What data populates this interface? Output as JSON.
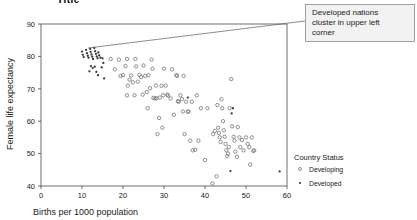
{
  "title_clipped": "Title",
  "callout": {
    "text_line1": "Developed nations",
    "text_line2": "cluster in upper left",
    "text_line3": "corner"
  },
  "legend": {
    "title": "Country Status",
    "items": [
      {
        "label": "Developing",
        "marker": "open-circle"
      },
      {
        "label": "Developed",
        "marker": "filled-dot"
      }
    ]
  },
  "chart_data": {
    "type": "scatter",
    "title": "",
    "xlabel": "Births per 1000 population",
    "ylabel": "Female life expectancy",
    "xlim": [
      0,
      60
    ],
    "ylim": [
      40,
      90
    ],
    "xticks": [
      0,
      10,
      20,
      30,
      40,
      50,
      60
    ],
    "yticks": [
      40,
      50,
      60,
      70,
      80,
      90
    ],
    "grid": false,
    "legend_position": "right",
    "annotation": "Developed nations cluster in upper left corner",
    "series": [
      {
        "name": "Developed",
        "marker": "filled-dot",
        "points": [
          [
            10.0,
            81.5
          ],
          [
            10.2,
            80.5
          ],
          [
            10.4,
            79.8
          ],
          [
            11.0,
            82.0
          ],
          [
            11.2,
            81.0
          ],
          [
            11.4,
            80.2
          ],
          [
            11.6,
            79.6
          ],
          [
            12.0,
            82.3
          ],
          [
            12.1,
            81.4
          ],
          [
            12.3,
            80.6
          ],
          [
            12.5,
            79.9
          ],
          [
            12.7,
            79.2
          ],
          [
            13.0,
            82.6
          ],
          [
            13.2,
            81.6
          ],
          [
            13.4,
            80.8
          ],
          [
            13.6,
            80.0
          ],
          [
            13.8,
            79.4
          ],
          [
            14.0,
            81.2
          ],
          [
            14.2,
            80.3
          ],
          [
            12.2,
            77.0
          ],
          [
            12.6,
            76.4
          ],
          [
            13.1,
            76.8
          ],
          [
            13.5,
            75.2
          ],
          [
            11.8,
            75.4
          ],
          [
            14.5,
            79.6
          ],
          [
            15.0,
            79.4
          ],
          [
            15.2,
            78.0
          ],
          [
            14.8,
            76.6
          ],
          [
            13.9,
            74.2
          ],
          [
            15.4,
            73.2
          ],
          [
            35.8,
            67.3
          ],
          [
            46.5,
            62.4
          ],
          [
            46.8,
            64.0
          ],
          [
            46.2,
            44.6
          ],
          [
            58.2,
            44.5
          ]
        ]
      },
      {
        "name": "Developing",
        "marker": "open-circle",
        "points": [
          [
            17.0,
            79.2
          ],
          [
            18.0,
            76.0
          ],
          [
            19.0,
            79.0
          ],
          [
            19.4,
            74.0
          ],
          [
            20.0,
            74.2
          ],
          [
            20.6,
            77.0
          ],
          [
            21.0,
            79.2
          ],
          [
            21.2,
            71.0
          ],
          [
            21.0,
            68.0
          ],
          [
            21.6,
            72.8
          ],
          [
            22.0,
            74.1
          ],
          [
            22.4,
            72.0
          ],
          [
            23.0,
            79.2
          ],
          [
            23.2,
            76.9
          ],
          [
            23.6,
            72.2
          ],
          [
            24.0,
            74.3
          ],
          [
            24.4,
            73.6
          ],
          [
            25.0,
            77.2
          ],
          [
            25.4,
            74.0
          ],
          [
            25.8,
            69.0
          ],
          [
            26.0,
            64.0
          ],
          [
            26.6,
            70.2
          ],
          [
            27.0,
            79.0
          ],
          [
            27.2,
            76.2
          ],
          [
            27.4,
            67.2
          ],
          [
            27.8,
            67.0
          ],
          [
            28.0,
            71.0
          ],
          [
            28.2,
            67.1
          ],
          [
            28.4,
            56.0
          ],
          [
            28.8,
            61.0
          ],
          [
            29.0,
            67.3
          ],
          [
            29.4,
            70.9
          ],
          [
            29.6,
            58.0
          ],
          [
            30.0,
            76.2
          ],
          [
            30.4,
            71.0
          ],
          [
            30.8,
            68.2
          ],
          [
            31.0,
            67.9
          ],
          [
            31.6,
            67.0
          ],
          [
            32.0,
            76.0
          ],
          [
            32.4,
            62.0
          ],
          [
            33.0,
            74.2
          ],
          [
            33.2,
            74.0
          ],
          [
            33.4,
            66.2
          ],
          [
            33.6,
            66.0
          ],
          [
            34.0,
            68.0
          ],
          [
            34.4,
            66.8
          ],
          [
            34.6,
            63.0
          ],
          [
            35.0,
            56.0
          ],
          [
            35.4,
            66.0
          ],
          [
            35.8,
            62.9
          ],
          [
            36.0,
            63.0
          ],
          [
            36.4,
            54.0
          ],
          [
            36.8,
            66.0
          ],
          [
            37.0,
            51.0
          ],
          [
            37.6,
            51.2
          ],
          [
            38.0,
            68.0
          ],
          [
            38.4,
            54.0
          ],
          [
            39.0,
            64.0
          ],
          [
            40.0,
            48.0
          ],
          [
            40.6,
            64.0
          ],
          [
            41.8,
            40.8
          ],
          [
            42.0,
            56.0
          ],
          [
            42.4,
            57.0
          ],
          [
            42.8,
            43.0
          ],
          [
            43.0,
            65.0
          ],
          [
            43.2,
            58.0
          ],
          [
            43.4,
            56.4
          ],
          [
            43.6,
            55.0
          ],
          [
            43.8,
            53.6
          ],
          [
            44.0,
            66.8
          ],
          [
            44.2,
            64.0
          ],
          [
            44.4,
            60.0
          ],
          [
            44.6,
            57.2
          ],
          [
            44.8,
            55.2
          ],
          [
            45.0,
            53.0
          ],
          [
            45.2,
            51.0
          ],
          [
            45.4,
            49.2
          ],
          [
            45.6,
            50.0
          ],
          [
            45.8,
            52.0
          ],
          [
            46.0,
            64.0
          ],
          [
            46.4,
            73.0
          ],
          [
            46.6,
            58.4
          ],
          [
            47.0,
            55.2
          ],
          [
            47.2,
            54.0
          ],
          [
            47.4,
            50.6
          ],
          [
            47.8,
            49.0
          ],
          [
            48.0,
            58.2
          ],
          [
            48.4,
            55.0
          ],
          [
            48.6,
            52.0
          ],
          [
            49.0,
            54.2
          ],
          [
            49.4,
            51.0
          ],
          [
            50.0,
            55.0
          ],
          [
            50.4,
            53.0
          ],
          [
            50.8,
            52.0
          ],
          [
            51.0,
            46.6
          ],
          [
            51.4,
            55.0
          ],
          [
            51.8,
            50.8
          ],
          [
            52.0,
            51.0
          ],
          [
            34.8,
            74.0
          ],
          [
            26.2,
            74.2
          ],
          [
            29.8,
            68.0
          ],
          [
            24.8,
            68.2
          ],
          [
            22.8,
            68.0
          ]
        ]
      }
    ]
  }
}
